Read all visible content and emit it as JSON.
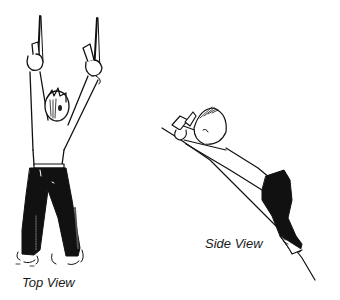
{
  "figure": {
    "panels": [
      {
        "id": "top",
        "caption": "Top View"
      },
      {
        "id": "side",
        "caption": "Side View"
      }
    ],
    "colors": {
      "ink": "#111111",
      "background": "#ffffff"
    }
  }
}
